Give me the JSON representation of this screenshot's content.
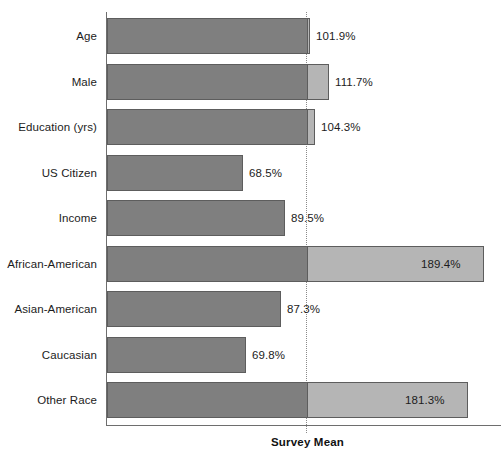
{
  "chart_data": {
    "type": "bar",
    "orientation": "horizontal",
    "title": "",
    "xlabel": "",
    "ylabel": "",
    "categories": [
      "Age",
      "Male",
      "Education (yrs)",
      "US Citizen",
      "Income",
      "African-American",
      "Asian-American",
      "Caucasian",
      "Other Race"
    ],
    "values": [
      101.9,
      111.7,
      104.3,
      68.5,
      89.5,
      189.4,
      87.3,
      69.8,
      181.3
    ],
    "value_labels": [
      "101.9%",
      "111.7%",
      "104.3%",
      "68.5%",
      "89.5%",
      "189.4%",
      "87.3%",
      "69.8%",
      "181.3%"
    ],
    "label_placement": [
      "outside",
      "outside",
      "outside",
      "outside",
      "outside",
      "inside",
      "outside",
      "outside",
      "inside"
    ],
    "reference_line": {
      "label": "Survey Mean",
      "value": 100,
      "style": "dotted"
    },
    "xlim": [
      0,
      197
    ],
    "grid": false,
    "legend": null,
    "colors": {
      "below_mean": "#7f7f7f",
      "above_mean": "#b5b5b5",
      "bar_outline": "#5d5d5d",
      "axis": "#6e6e6e",
      "reference_line": "#8a8a8a",
      "text": "#1c1c1c",
      "background": "#ffffff"
    }
  }
}
